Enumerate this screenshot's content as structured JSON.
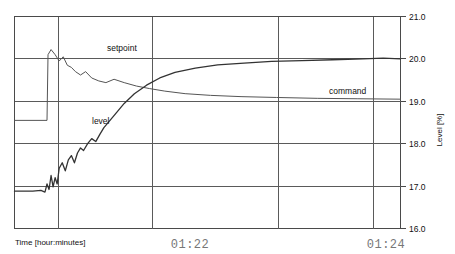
{
  "chart_data": {
    "type": "line",
    "title": "",
    "xlabel": "Time [hour:minutes]",
    "ylabel": "Level [%]",
    "grid": true,
    "legend_position": "inline-annotations",
    "ylim": [
      16.0,
      21.0
    ],
    "yticks": [
      "21.0",
      "20.0",
      "19.0",
      "18.0",
      "17.0",
      "16.0"
    ],
    "ytick_values": [
      21.0,
      20.0,
      19.0,
      18.0,
      17.0,
      16.0
    ],
    "xticks": [
      "01:22",
      "01:24"
    ],
    "xtick_values": [
      82,
      84
    ],
    "xlim": [
      80.62,
      84.42
    ],
    "annotations": [
      {
        "text": "setpoint",
        "x": 81.55,
        "y": 20.22
      },
      {
        "text": "level",
        "x": 81.4,
        "y": 18.48
      },
      {
        "text": "command",
        "x": 83.6,
        "y": 19.2
      }
    ],
    "series": [
      {
        "name": "setpoint",
        "color": "#555555",
        "description": "Step from 18.55% to 20.0% at 01:21.0, then slight overshoot and decay toward 19.05%",
        "x": [
          80.62,
          80.94,
          80.95,
          80.98,
          81.02,
          81.06,
          81.1,
          81.14,
          81.18,
          81.22,
          81.27,
          81.32,
          81.38,
          81.45,
          81.52,
          81.6,
          81.7,
          81.82,
          81.95,
          82.1,
          82.3,
          82.55,
          82.85,
          83.2,
          83.6,
          84.0,
          84.42
        ],
        "y": [
          18.55,
          18.55,
          20.1,
          20.22,
          20.1,
          19.95,
          20.05,
          19.85,
          19.8,
          19.7,
          19.62,
          19.7,
          19.55,
          19.48,
          19.44,
          19.52,
          19.44,
          19.36,
          19.3,
          19.24,
          19.18,
          19.14,
          19.11,
          19.09,
          19.07,
          19.06,
          19.05
        ]
      },
      {
        "name": "level",
        "color": "#333333",
        "description": "Starts near 16.9%, noisy rise from 01:21 and asymptotes to 20.0%",
        "x": [
          80.62,
          80.8,
          80.88,
          80.92,
          80.94,
          80.96,
          80.98,
          81.0,
          81.02,
          81.04,
          81.06,
          81.09,
          81.12,
          81.15,
          81.18,
          81.21,
          81.24,
          81.27,
          81.3,
          81.34,
          81.38,
          81.42,
          81.46,
          81.5,
          81.55,
          81.62,
          81.7,
          81.8,
          81.92,
          82.05,
          82.2,
          82.4,
          82.62,
          82.88,
          83.15,
          83.45,
          83.75,
          84.05,
          84.25,
          84.42
        ],
        "y": [
          16.88,
          16.88,
          16.9,
          16.86,
          17.05,
          16.92,
          17.25,
          16.98,
          17.2,
          17.05,
          17.42,
          17.55,
          17.36,
          17.62,
          17.72,
          17.55,
          17.78,
          17.9,
          17.84,
          18.0,
          18.12,
          18.05,
          18.22,
          18.38,
          18.52,
          18.72,
          18.95,
          19.18,
          19.38,
          19.55,
          19.68,
          19.78,
          19.86,
          19.9,
          19.94,
          19.96,
          19.98,
          20.0,
          20.02,
          20.0
        ]
      }
    ]
  },
  "axes": {
    "y_axis_title": "Level [%]",
    "x_axis_title": "Time [hour:minutes]"
  },
  "colors": {
    "frame": "#4a4a4a",
    "grid": "#5a5a5a",
    "setpoint": "#555555",
    "level": "#333333",
    "time_label": "#777777",
    "background": "#ffffff"
  }
}
